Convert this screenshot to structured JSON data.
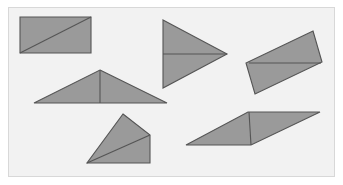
{
  "canvas": {
    "width": 343,
    "height": 185,
    "background": "#ffffff"
  },
  "panel": {
    "name": "figure-panel",
    "x": 8,
    "y": 7,
    "width": 327,
    "height": 170,
    "fill": "#f2f2f2",
    "border_color": "#d8d8d8"
  },
  "style": {
    "shape_fill": "#9a9a9a",
    "shape_stroke": "#555555",
    "stroke_width": 1.1
  },
  "diagram": {
    "type": "geometry-figure",
    "shape_count": 6
  },
  "shapes": [
    {
      "id": "shape-1",
      "name": "rectangle-with-diagonal",
      "kind": "rectangle",
      "points": "20,17 91,17 91,53 20,53",
      "divider": {
        "x1": 20,
        "y1": 53,
        "x2": 91,
        "y2": 17
      },
      "divider_kind": "diagonal"
    },
    {
      "id": "shape-2",
      "name": "right-pointing-triangle-with-horizontal-divider",
      "kind": "triangle",
      "points": "163,20 227,54 163,88",
      "divider": {
        "x1": 163,
        "y1": 54,
        "x2": 227,
        "y2": 54
      },
      "divider_kind": "horizontal"
    },
    {
      "id": "shape-3",
      "name": "slanted-parallelogram-with-horizontal-divider",
      "kind": "parallelogram",
      "points": "313,31 322,62 255,94 246,63",
      "divider": {
        "x1": 249,
        "y1": 63,
        "x2": 321,
        "y2": 63
      },
      "divider_kind": "horizontal"
    },
    {
      "id": "shape-4",
      "name": "wide-triangle-with-vertical-divider",
      "kind": "triangle",
      "points": "100,70 167,103 34,103",
      "divider": {
        "x1": 100,
        "y1": 70,
        "x2": 100,
        "y2": 103
      },
      "divider_kind": "vertical-altitude"
    },
    {
      "id": "shape-5",
      "name": "quadrilateral-with-diagonal",
      "kind": "quadrilateral",
      "points": "123,114 150,135 150,163 87,163",
      "divider": {
        "x1": 87,
        "y1": 163,
        "x2": 150,
        "y2": 135
      },
      "divider_kind": "diagonal"
    },
    {
      "id": "shape-6",
      "name": "flat-parallelogram-with-vertical-divider",
      "kind": "parallelogram",
      "points": "248,112 320,112 251,145 186,145",
      "divider": {
        "x1": 249,
        "y1": 112,
        "x2": 251,
        "y2": 145
      },
      "divider_kind": "vertical"
    }
  ]
}
